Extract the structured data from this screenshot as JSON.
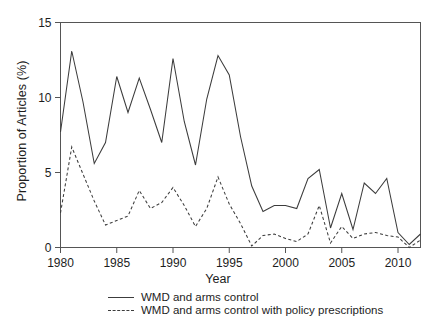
{
  "chart_data": {
    "type": "line",
    "title": "",
    "xlabel": "Year",
    "ylabel": "Proportion of Articles (%)",
    "xlim": [
      1980,
      2012
    ],
    "ylim": [
      0,
      15
    ],
    "xticks": [
      1980,
      1985,
      1990,
      1995,
      2000,
      2005,
      2010
    ],
    "yticks": [
      0,
      5,
      10,
      15
    ],
    "grid": false,
    "legend_position": "bottom-center",
    "line_color": "#3c3c3c",
    "x": [
      1980,
      1981,
      1982,
      1983,
      1984,
      1985,
      1986,
      1987,
      1988,
      1989,
      1990,
      1991,
      1992,
      1993,
      1994,
      1995,
      1996,
      1997,
      1998,
      1999,
      2000,
      2001,
      2002,
      2003,
      2004,
      2005,
      2006,
      2007,
      2008,
      2009,
      2010,
      2011,
      2012
    ],
    "series": [
      {
        "name": "WMD and arms control",
        "style": "solid",
        "values": [
          7.7,
          13.1,
          9.7,
          5.6,
          7.0,
          11.4,
          9.0,
          11.3,
          9.2,
          7.0,
          12.6,
          8.4,
          5.5,
          9.9,
          12.8,
          11.5,
          7.4,
          4.1,
          2.4,
          2.8,
          2.8,
          2.6,
          4.6,
          5.2,
          1.3,
          3.6,
          1.2,
          4.3,
          3.6,
          4.6,
          1.0,
          0.2,
          0.9
        ]
      },
      {
        "name": "WMD and arms control with policy prescriptions",
        "style": "dashed",
        "values": [
          2.3,
          6.7,
          4.9,
          3.1,
          1.5,
          1.8,
          2.1,
          3.8,
          2.6,
          3.0,
          4.0,
          2.8,
          1.4,
          2.6,
          4.7,
          2.9,
          1.6,
          0.1,
          0.8,
          0.9,
          0.6,
          0.4,
          0.9,
          2.8,
          0.3,
          1.4,
          0.6,
          0.9,
          1.0,
          0.8,
          0.7,
          0.0,
          0.5
        ]
      }
    ]
  },
  "legend": {
    "items": [
      {
        "label": "WMD and arms control",
        "style": "solid"
      },
      {
        "label": "WMD and arms control with policy prescriptions",
        "style": "dashed"
      }
    ]
  }
}
